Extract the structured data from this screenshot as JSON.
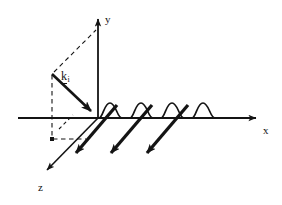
{
  "figure": {
    "background_color": "#ffffff",
    "stroke_color": "#141414",
    "axes": {
      "x": {
        "label": "x",
        "direction": "right",
        "origin_px": [
          98,
          118
        ],
        "tip_px": [
          262,
          118
        ],
        "tail_px": [
          18,
          118
        ],
        "arrowhead": true
      },
      "y": {
        "label": "y",
        "direction": "up",
        "origin_px": [
          98,
          118
        ],
        "tip_px": [
          98,
          13
        ],
        "arrowhead": true
      },
      "z": {
        "label": "z",
        "direction": "down-left",
        "origin_px": [
          98,
          118
        ],
        "tip_px": [
          41,
          176
        ],
        "arrowhead": true
      }
    },
    "vectors": [
      {
        "name": "incident-wavevector",
        "label": "k",
        "subscript": "i",
        "notation": "underlined-vector",
        "tail_px": [
          52,
          74
        ],
        "tip_px": [
          97,
          117
        ],
        "arrowhead": true,
        "stroke_width": 2.6
      }
    ],
    "construction_lines": {
      "style": "dashed",
      "segments": [
        {
          "name": "ki-to-y-axis-dashed",
          "from_px": [
            54,
            72
          ],
          "to_px": [
            96,
            30
          ]
        },
        {
          "name": "vertical-projection-dashed",
          "from_px": [
            52,
            75
          ],
          "to_px": [
            52,
            139
          ]
        },
        {
          "name": "horizontal-projection-dashed",
          "from_px": [
            53,
            139
          ],
          "to_px": [
            86,
            139
          ]
        },
        {
          "name": "angle-indicator-dashed",
          "from_px": [
            59,
            128
          ],
          "to_px": [
            72,
            115
          ]
        }
      ]
    },
    "wave": {
      "name": "surface-wave",
      "type": "sinusoid",
      "start_px": [
        99,
        118
      ],
      "end_px": [
        216,
        118
      ],
      "amplitude_px": 15,
      "wavelength_px": 31,
      "cycles": 3.7,
      "stroke_width": 1.6
    },
    "propagation_arrows": {
      "name": "z-parallel-rays",
      "count": 3,
      "direction": "down-left parallel to z-axis",
      "stroke_width": 3.2,
      "arrowhead": true,
      "rays": [
        {
          "tail_px": [
            117,
            106
          ],
          "tip_px": [
            70,
            159
          ]
        },
        {
          "tail_px": [
            152,
            106
          ],
          "tip_px": [
            105,
            159
          ]
        },
        {
          "tail_px": [
            188,
            106
          ],
          "tip_px": [
            141,
            159
          ]
        }
      ]
    }
  }
}
